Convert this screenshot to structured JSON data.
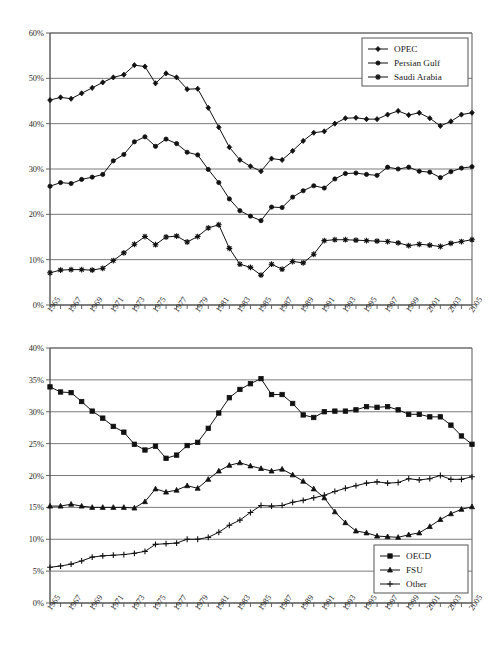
{
  "chart_data": [
    {
      "id": "opec-share-chart",
      "type": "line",
      "title": "",
      "xlabel": "",
      "ylabel": "",
      "xlim": [
        1965,
        2005
      ],
      "ylim": [
        0,
        60
      ],
      "ytick_labels": [
        "0%",
        "10%",
        "20%",
        "30%",
        "40%",
        "50%",
        "60%"
      ],
      "ytick_values": [
        0,
        10,
        20,
        30,
        40,
        50,
        60
      ],
      "grid": true,
      "legend_position": "top-right",
      "x": [
        1965,
        1966,
        1967,
        1968,
        1969,
        1970,
        1971,
        1972,
        1973,
        1974,
        1975,
        1976,
        1977,
        1978,
        1979,
        1980,
        1981,
        1982,
        1983,
        1984,
        1985,
        1986,
        1987,
        1988,
        1989,
        1990,
        1991,
        1992,
        1993,
        1994,
        1995,
        1996,
        1997,
        1998,
        1999,
        2000,
        2001,
        2002,
        2003,
        2004,
        2005
      ],
      "xtick_labels": [
        "1965",
        "1967",
        "1969",
        "1971",
        "1973",
        "1975",
        "1977",
        "1979",
        "1981",
        "1983",
        "1985",
        "1987",
        "1989",
        "1991",
        "1993",
        "1995",
        "1997",
        "1999",
        "2001",
        "2003",
        "2005"
      ],
      "series": [
        {
          "name": "OPEC",
          "marker": "diamond",
          "values": [
            45.2,
            45.8,
            45.5,
            46.7,
            47.9,
            49.1,
            50.2,
            50.8,
            52.9,
            52.6,
            48.9,
            51.1,
            50.2,
            47.6,
            47.7,
            43.5,
            39.2,
            34.8,
            32.0,
            30.6,
            29.5,
            32.3,
            32.0,
            34.0,
            36.2,
            38.0,
            38.3,
            40.0,
            41.2,
            41.3,
            41.0,
            41.0,
            42.0,
            42.8,
            41.9,
            42.4,
            41.2,
            39.5,
            40.5,
            42.0,
            42.4
          ]
        },
        {
          "name": "Persian Gulf",
          "marker": "circle",
          "values": [
            26.2,
            27.0,
            26.8,
            27.7,
            28.2,
            28.8,
            31.8,
            33.2,
            36.0,
            37.1,
            35.0,
            36.6,
            35.6,
            33.7,
            33.1,
            29.9,
            27.0,
            23.4,
            20.8,
            19.6,
            18.6,
            21.6,
            21.5,
            23.8,
            25.2,
            26.3,
            25.8,
            27.8,
            29.0,
            29.1,
            28.8,
            28.6,
            30.4,
            30.0,
            30.4,
            29.5,
            29.3,
            28.1,
            29.4,
            30.2,
            30.5
          ]
        },
        {
          "name": "Saudi Arabia",
          "marker": "asterisk",
          "values": [
            7.1,
            7.7,
            7.8,
            7.8,
            7.7,
            8.1,
            9.8,
            11.5,
            13.4,
            15.1,
            13.3,
            15.0,
            15.2,
            13.9,
            15.1,
            17.0,
            17.7,
            12.5,
            9.0,
            8.3,
            6.6,
            9.0,
            7.9,
            9.6,
            9.3,
            11.2,
            14.2,
            14.4,
            14.4,
            14.3,
            14.2,
            14.1,
            14.0,
            13.7,
            13.1,
            13.4,
            13.2,
            12.9,
            13.6,
            14.0,
            14.4
          ]
        }
      ]
    },
    {
      "id": "consumption-share-chart",
      "type": "line",
      "title": "",
      "xlabel": "",
      "ylabel": "",
      "xlim": [
        1965,
        2005
      ],
      "ylim": [
        0,
        40
      ],
      "ytick_labels": [
        "0%",
        "5%",
        "10%",
        "15%",
        "20%",
        "25%",
        "30%",
        "35%",
        "40%"
      ],
      "ytick_values": [
        0,
        5,
        10,
        15,
        20,
        25,
        30,
        35,
        40
      ],
      "grid": true,
      "legend_position": "bottom-right",
      "x": [
        1965,
        1966,
        1967,
        1968,
        1969,
        1970,
        1971,
        1972,
        1973,
        1974,
        1975,
        1976,
        1977,
        1978,
        1979,
        1980,
        1981,
        1982,
        1983,
        1984,
        1985,
        1986,
        1987,
        1988,
        1989,
        1990,
        1991,
        1992,
        1993,
        1994,
        1995,
        1996,
        1997,
        1998,
        1999,
        2000,
        2001,
        2002,
        2003,
        2004,
        2005
      ],
      "xtick_labels": [
        "1965",
        "1967",
        "1969",
        "1971",
        "1973",
        "1975",
        "1977",
        "1979",
        "1981",
        "1983",
        "1985",
        "1987",
        "1989",
        "1991",
        "1993",
        "1995",
        "1997",
        "1999",
        "2001",
        "2003",
        "2005"
      ],
      "series": [
        {
          "name": "OECD",
          "marker": "square",
          "values": [
            33.9,
            33.1,
            33.0,
            31.6,
            30.1,
            29.0,
            27.7,
            26.8,
            24.9,
            24.0,
            24.6,
            22.7,
            23.2,
            24.7,
            25.2,
            27.4,
            29.8,
            32.2,
            33.5,
            34.4,
            35.2,
            32.7,
            32.7,
            31.3,
            29.5,
            29.1,
            30.0,
            30.1,
            30.1,
            30.3,
            30.8,
            30.7,
            30.8,
            30.3,
            29.6,
            29.6,
            29.2,
            29.2,
            27.9,
            26.2,
            24.9
          ]
        },
        {
          "name": "FSU",
          "marker": "triangle",
          "values": [
            15.2,
            15.2,
            15.5,
            15.2,
            15.0,
            15.0,
            15.0,
            15.0,
            14.9,
            15.9,
            17.9,
            17.4,
            17.7,
            18.4,
            18.0,
            19.4,
            20.7,
            21.6,
            22.0,
            21.5,
            21.1,
            20.7,
            21.0,
            20.1,
            19.1,
            17.9,
            16.5,
            14.3,
            12.6,
            11.3,
            11.0,
            10.5,
            10.4,
            10.3,
            10.7,
            11.0,
            12.0,
            13.1,
            14.0,
            14.7,
            15.1
          ]
        },
        {
          "name": "Other",
          "marker": "plus",
          "values": [
            5.6,
            5.8,
            6.1,
            6.6,
            7.2,
            7.4,
            7.5,
            7.6,
            7.8,
            8.1,
            9.2,
            9.3,
            9.4,
            10.0,
            10.0,
            10.3,
            11.1,
            12.2,
            13.0,
            14.2,
            15.3,
            15.2,
            15.3,
            15.8,
            16.1,
            16.5,
            16.9,
            17.5,
            18.0,
            18.4,
            18.8,
            19.0,
            18.8,
            18.9,
            19.5,
            19.3,
            19.5,
            20.0,
            19.4,
            19.4,
            19.8
          ]
        }
      ]
    }
  ]
}
